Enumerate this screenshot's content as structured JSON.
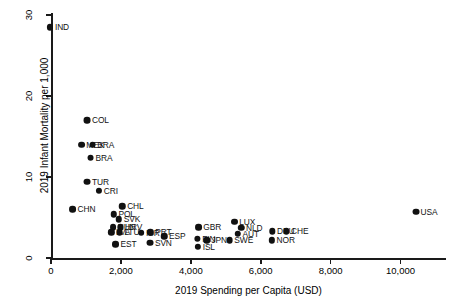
{
  "chart_data": {
    "type": "scatter",
    "title": "",
    "xlabel": "2019 Spending per Capita (USD)",
    "ylabel": "2019 Infant Mortality per 1,000",
    "xlim": [
      0,
      11300
    ],
    "ylim": [
      0,
      31
    ],
    "xticks": [
      0,
      2000,
      4000,
      6000,
      8000,
      10000
    ],
    "xticklabels": [
      "0",
      "2,000",
      "4,000",
      "6,000",
      "8,000",
      "10,000"
    ],
    "yticks": [
      0,
      10,
      20,
      30
    ],
    "yticklabels": [
      "0",
      "10",
      "20",
      "30"
    ],
    "grid": false,
    "legend": null,
    "point_color": "#111111",
    "points": [
      {
        "label": "IND",
        "x": 200,
        "y": 28.5
      },
      {
        "label": "COL",
        "x": 1300,
        "y": 17.0
      },
      {
        "label": "MEX",
        "x": 1150,
        "y": 14.0
      },
      {
        "label": "BRA",
        "x": 1450,
        "y": 14.0
      },
      {
        "label": "BRA",
        "x": 1400,
        "y": 12.4
      },
      {
        "label": "TUR",
        "x": 1300,
        "y": 9.4
      },
      {
        "label": "CRI",
        "x": 1600,
        "y": 8.3
      },
      {
        "label": "CHN",
        "x": 900,
        "y": 6.0
      },
      {
        "label": "CHL",
        "x": 2300,
        "y": 6.4
      },
      {
        "label": "POL",
        "x": 2050,
        "y": 5.4
      },
      {
        "label": "SVK",
        "x": 2200,
        "y": 4.8
      },
      {
        "label": "HUN",
        "x": 2050,
        "y": 3.8
      },
      {
        "label": "HRV",
        "x": 2250,
        "y": 3.8
      },
      {
        "label": "LVA",
        "x": 1950,
        "y": 3.2
      },
      {
        "label": "LTU",
        "x": 2200,
        "y": 3.2
      },
      {
        "label": "ISR",
        "x": 2800,
        "y": 3.1
      },
      {
        "label": "PRT",
        "x": 3100,
        "y": 3.2
      },
      {
        "label": "ESP",
        "x": 3500,
        "y": 2.7
      },
      {
        "label": "EST",
        "x": 2100,
        "y": 1.7
      },
      {
        "label": "SVN",
        "x": 3100,
        "y": 1.9
      },
      {
        "label": "GBR",
        "x": 4500,
        "y": 3.8
      },
      {
        "label": "LUX",
        "x": 5500,
        "y": 4.5
      },
      {
        "label": "NLD",
        "x": 5700,
        "y": 3.7
      },
      {
        "label": "AUT",
        "x": 5600,
        "y": 3.0
      },
      {
        "label": "FIN",
        "x": 4400,
        "y": 2.4
      },
      {
        "label": "JPN",
        "x": 4700,
        "y": 2.2
      },
      {
        "label": "SWE",
        "x": 5400,
        "y": 2.2
      },
      {
        "label": "ISL",
        "x": 4400,
        "y": 1.4
      },
      {
        "label": "DEU",
        "x": 6600,
        "y": 3.3
      },
      {
        "label": "CHE",
        "x": 7000,
        "y": 3.3
      },
      {
        "label": "NOR",
        "x": 6600,
        "y": 2.2
      },
      {
        "label": "USA",
        "x": 10700,
        "y": 5.7
      }
    ]
  }
}
